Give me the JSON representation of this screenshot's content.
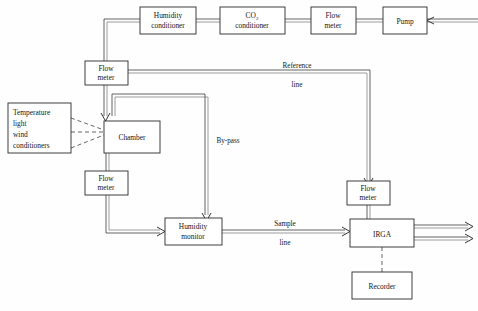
{
  "diagram": {
    "boxes": [
      {
        "id": "humidity-conditioner",
        "line1": "Humidity",
        "line2": "conditioner"
      },
      {
        "id": "co2-conditioner",
        "line1": "CO",
        "sub": "2",
        "line2": "conditioner"
      },
      {
        "id": "flow-meter-top",
        "line1": "Flow",
        "line2": "meter"
      },
      {
        "id": "pump",
        "line1": "Pump",
        "line2": ""
      },
      {
        "id": "flow-meter-left-upper",
        "line1": "Flow",
        "line2": "meter"
      },
      {
        "id": "conditioners",
        "line1": "Temperature",
        "line2": "light",
        "line3": "wind",
        "line4": "conditioners"
      },
      {
        "id": "chamber",
        "line1": "Chamber",
        "line2": ""
      },
      {
        "id": "flow-meter-left-lower",
        "line1": "Flow",
        "line2": "meter"
      },
      {
        "id": "humidity-monitor",
        "line1": "Humidity",
        "line2": "monitor"
      },
      {
        "id": "flow-meter-right",
        "line1": "Flow",
        "line2": "meter"
      },
      {
        "id": "irga",
        "line1": "IRGA",
        "line2": ""
      },
      {
        "id": "recorder",
        "line1": "Recorder",
        "line2": ""
      }
    ],
    "line_labels": {
      "reference_top": "Reference",
      "reference_bottom": "line",
      "bypass": "By-pass",
      "sample_top": "Sample",
      "sample_bottom": "line"
    },
    "colors": {
      "box_stroke": "#2b2b2b",
      "pipe": "#4a4a4a",
      "pipe_secondary": "#8d8d8d",
      "dashed": "#555555",
      "background": "#fefefe",
      "text": "#161616"
    }
  }
}
